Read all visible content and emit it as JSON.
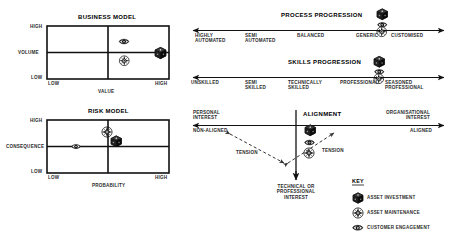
{
  "business_model": {
    "title": "BUSINESS MODEL",
    "y_axis_label": "VOLUME",
    "y_high": "HIGH",
    "y_low": "LOW",
    "x_axis_label": "VALUE",
    "x_low": "LOW",
    "x_high": "HIGH",
    "markers": [
      {
        "icon": "customer-engagement-icon",
        "x": 0.62,
        "y": 0.7
      },
      {
        "icon": "asset-investment-icon",
        "x": 0.93,
        "y": 0.5
      },
      {
        "icon": "asset-maintenance-icon",
        "x": 0.62,
        "y": 0.33
      }
    ]
  },
  "risk_model": {
    "title": "RISK MODEL",
    "y_axis_label": "CONSEQUENCE",
    "y_high": "HIGH",
    "y_low": "LOW",
    "x_axis_label": "PROBABILITY",
    "x_low": "LOW",
    "x_high": "HIGH",
    "markers": [
      {
        "icon": "asset-maintenance-icon",
        "x": 0.5,
        "y": 0.75
      },
      {
        "icon": "asset-investment-icon",
        "x": 0.6,
        "y": 0.6
      },
      {
        "icon": "customer-engagement-icon",
        "x": 0.24,
        "y": 0.5
      }
    ]
  },
  "process_progression": {
    "title": "PROCESS PROGRESSION",
    "scale": [
      "HIGHLY\nAUTOMATED",
      "SEMI\nAUTOMATED",
      "BALANCED",
      "GENERIC",
      "CUSTOMISED"
    ],
    "markers": [
      "asset-investment-icon",
      "customer-engagement-icon",
      "asset-maintenance-icon"
    ]
  },
  "skills_progression": {
    "title": "SKILLS PROGRESSION",
    "scale": [
      "UNSKILLED",
      "SEMI\nSKILLED",
      "TECHNICALLY\nSKILLED",
      "PROFESSIONAL",
      "SEASONED\nPROFESSIONAL"
    ],
    "markers": [
      "asset-investment-icon",
      "customer-engagement-icon",
      "asset-maintenance-icon"
    ]
  },
  "alignment": {
    "title": "ALIGNMENT",
    "left_top": "PERSONAL\nINTEREST",
    "right_top": "ORGANISATIONAL\nINTEREST",
    "left_axis": "NON-ALIGNED",
    "right_axis": "ALIGNED",
    "bottom": "TECHNICAL OR\nPROFESSIONAL\nINTEREST",
    "tension_left": "TENSION",
    "tension_right": "TENSION",
    "markers": [
      "asset-investment-icon",
      "customer-engagement-icon",
      "asset-maintenance-icon"
    ]
  },
  "key": {
    "title": "KEY",
    "items": [
      {
        "icon": "asset-investment-icon",
        "label": "ASSET INVESTMENT"
      },
      {
        "icon": "asset-maintenance-icon",
        "label": "ASSET MAINTENANCE"
      },
      {
        "icon": "customer-engagement-icon",
        "label": "CUSTOMER ENGAGEMENT"
      }
    ]
  },
  "colors": {
    "ink": "#1a1a1a",
    "line": "#111111",
    "text": "#2b2b2b",
    "background": "#ffffff"
  }
}
